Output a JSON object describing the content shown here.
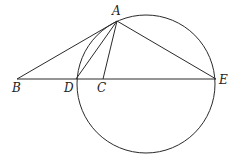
{
  "diagram": {
    "type": "geometry",
    "circle": {
      "cx": 146,
      "cy": 84,
      "r": 69
    },
    "points": {
      "A": {
        "x": 117,
        "y": 21,
        "label": "A",
        "lx": 112,
        "ly": 15
      },
      "B": {
        "x": 17,
        "y": 79,
        "label": "B",
        "lx": 12,
        "ly": 92
      },
      "D": {
        "x": 76,
        "y": 79,
        "label": "D",
        "lx": 64,
        "ly": 92
      },
      "C": {
        "x": 103,
        "y": 79,
        "label": "C",
        "lx": 97,
        "ly": 92
      },
      "E": {
        "x": 216,
        "y": 79,
        "label": "E",
        "lx": 219,
        "ly": 84
      }
    },
    "segments": [
      [
        "B",
        "E"
      ],
      [
        "B",
        "A"
      ],
      [
        "A",
        "D"
      ],
      [
        "A",
        "C"
      ],
      [
        "A",
        "E"
      ]
    ]
  }
}
